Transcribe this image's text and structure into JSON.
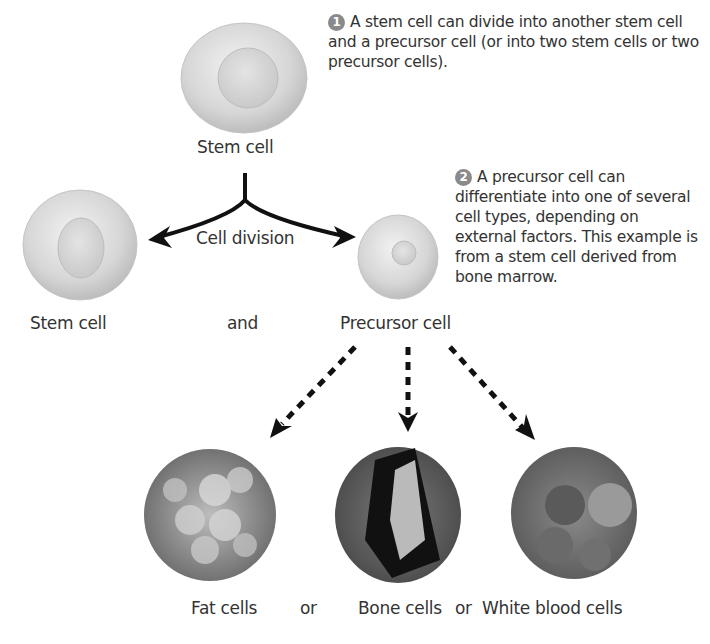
{
  "diagram": {
    "step1": {
      "number": "1",
      "text": "A stem cell can divide into another stem cell and a precursor cell (or into two stem cells or two precursor cells)."
    },
    "step2": {
      "number": "2",
      "text": "A precursor cell can differentiate into one of several cell types, depending on external factors. This example is from a stem cell derived from bone marrow."
    },
    "labels": {
      "top_stem_cell": "Stem cell",
      "cell_division": "Cell division",
      "left_stem_cell": "Stem cell",
      "and": "and",
      "precursor_cell": "Precursor cell",
      "fat_cells": "Fat cells",
      "or1": "or",
      "bone_cells": "Bone cells",
      "or2": "or",
      "white_blood_cells": "White blood cells"
    }
  }
}
